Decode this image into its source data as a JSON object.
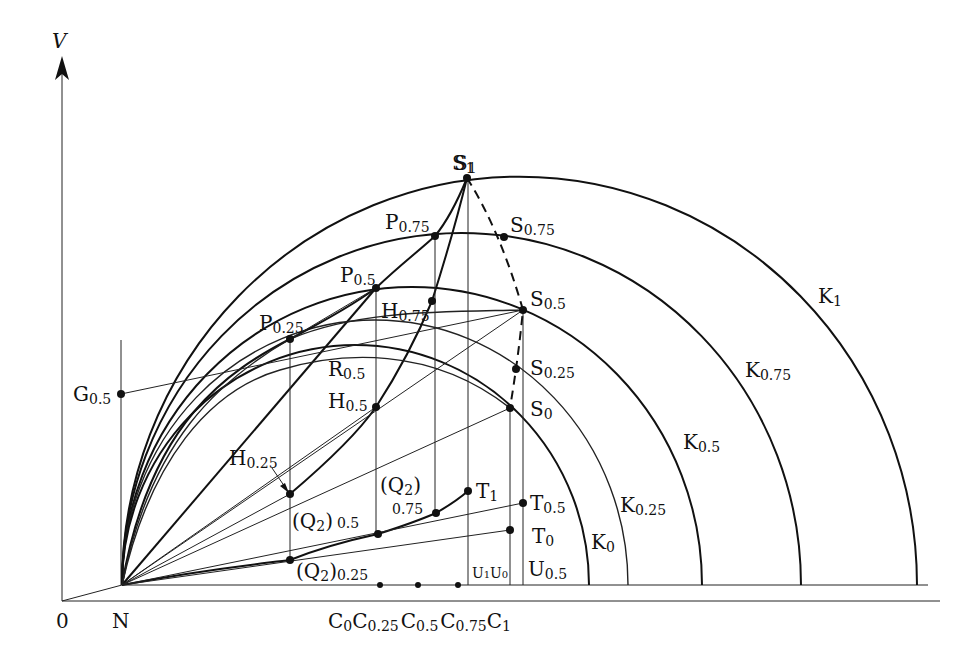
{
  "axes": {
    "y_label": "V",
    "origin_label": "0",
    "n_label": "N"
  },
  "curves": {
    "K": [
      {
        "id": "K1",
        "main": "K",
        "sub": "1"
      },
      {
        "id": "K0.75",
        "main": "K",
        "sub": "0.75"
      },
      {
        "id": "K0.5",
        "main": "K",
        "sub": "0.5"
      },
      {
        "id": "K0.25",
        "main": "K",
        "sub": "0.25"
      },
      {
        "id": "K0",
        "main": "K",
        "sub": "0"
      }
    ]
  },
  "points": {
    "S1": {
      "main": "S",
      "sub": "1"
    },
    "S0.75": {
      "main": "S",
      "sub": "0.75"
    },
    "S0.5": {
      "main": "S",
      "sub": "0.5"
    },
    "S0.25": {
      "main": "S",
      "sub": "0.25"
    },
    "S0": {
      "main": "S",
      "sub": "0"
    },
    "P0.75": {
      "main": "P",
      "sub": "0.75"
    },
    "P0.5": {
      "main": "P",
      "sub": "0.5"
    },
    "P0.25": {
      "main": "P",
      "sub": "0.25"
    },
    "H0.75": {
      "main": "H",
      "sub": "0.75"
    },
    "H0.5": {
      "main": "H",
      "sub": "0.5"
    },
    "H0.25": {
      "main": "H",
      "sub": "0.25"
    },
    "R0.5": {
      "main": "R",
      "sub": "0.5"
    },
    "G0.5": {
      "main": "G",
      "sub": "0.5"
    },
    "T1": {
      "main": "T",
      "sub": "1"
    },
    "T0.5": {
      "main": "T",
      "sub": "0.5"
    },
    "T0": {
      "main": "T",
      "sub": "0"
    },
    "Q2_0.75": {
      "main": "(Q",
      "inner": "2",
      "close": ")",
      "sub": "0.75"
    },
    "Q2_0.5": {
      "main": "(Q",
      "inner": "2",
      "close": ")",
      "sub": "0.5"
    },
    "Q2_0.25": {
      "main": "(Q",
      "inner": "2",
      "close": ")",
      "sub": "0.25"
    },
    "U1": {
      "main": "U",
      "sub": "1"
    },
    "U0": {
      "main": "U",
      "sub": "0"
    },
    "U0.5": {
      "main": "U",
      "sub": "0.5"
    }
  },
  "baseline_points": [
    {
      "main": "C",
      "sub": "0"
    },
    {
      "main": "C",
      "sub": "0.25"
    },
    {
      "main": "C",
      "sub": "0.5"
    },
    {
      "main": "C",
      "sub": "0.75"
    },
    {
      "main": "C",
      "sub": "1"
    }
  ],
  "colors": {
    "ink": "#111111",
    "background": "#ffffff"
  }
}
